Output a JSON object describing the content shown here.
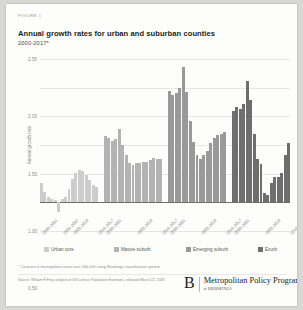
{
  "figure": {
    "label": "FIGURE 1",
    "title": "Annual growth rates for urban and suburban counties",
    "subtitle": "2000-2017*"
  },
  "footnote": "* Counties in metropolitan areas over 500,000 using Brookings classification system",
  "source": "Source: William H Frey analysis of US Census Population Estimates, released March 22, 2018",
  "brand": {
    "mark": "B",
    "name": "Metropolitan Policy Program",
    "sub": "at BROOKINGS"
  },
  "colors": {
    "urban_core": "#cccccc",
    "mature_suburb": "#b3b3b3",
    "emerging_suburb": "#999999",
    "exurb": "#6e6e6e",
    "gridline": "#e6e6e4",
    "axis": "#6e6e6c",
    "text_muted": "#8a8a88"
  },
  "chart_data": {
    "type": "bar",
    "title": "Annual growth rates for urban and suburban counties",
    "subtitle": "2000-2017*",
    "xlabel": "",
    "ylabel": "Annual growth rate",
    "ylim": [
      -0.5,
      2.5
    ],
    "yticks": [
      -0.5,
      0.0,
      0.5,
      1.0,
      1.5,
      2.0,
      2.5
    ],
    "ytick_labels": [
      "-0.50",
      "0.00",
      "0.50",
      "1.00",
      "1.50",
      "2.00",
      "2.50"
    ],
    "grid": true,
    "legend_position": "bottom",
    "x": [
      "2000-2001",
      "2001-2002",
      "2002-2003",
      "2003-2004",
      "2004-2005",
      "2005-2006",
      "2006-2007",
      "2007-2008",
      "2008-2009",
      "2009-2010",
      "2010-2011",
      "2011-2012",
      "2012-2013",
      "2013-2014",
      "2014-2015",
      "2015-2016",
      "2016-2017"
    ],
    "xtick_labels": [
      "2000-2001",
      "2006-2007",
      "2009-2010",
      "2016-2017",
      "2000-2001",
      "2009-2010",
      "2016-2017",
      "2000-2001",
      "2009-2010",
      "2016-2017",
      "2000-2001",
      "2009-2010",
      "2016-2017"
    ],
    "series": [
      {
        "name": "Urban core",
        "color": "#cccccc",
        "values": [
          0.33,
          0.18,
          0.1,
          0.06,
          0.04,
          -0.17,
          0.05,
          0.1,
          0.24,
          0.4,
          0.52,
          0.56,
          0.54,
          0.47,
          0.39,
          0.31,
          0.26
        ]
      },
      {
        "name": "Mature suburb",
        "color": "#b3b3b3",
        "values": [
          1.16,
          1.12,
          1.07,
          1.11,
          1.28,
          1.0,
          0.83,
          0.69,
          0.65,
          0.68,
          0.69,
          0.71,
          0.7,
          0.73,
          0.78,
          0.75,
          0.76
        ]
      },
      {
        "name": "Emerging suburb",
        "color": "#999999",
        "values": [
          1.95,
          1.88,
          1.9,
          1.99,
          2.36,
          1.93,
          1.41,
          1.05,
          0.83,
          0.76,
          0.83,
          0.9,
          1.03,
          1.13,
          1.17,
          1.2,
          1.22
        ]
      },
      {
        "name": "Exurb",
        "color": "#6e6e6e",
        "values": [
          1.6,
          1.66,
          1.63,
          1.72,
          2.11,
          1.79,
          1.2,
          0.75,
          0.66,
          0.16,
          0.13,
          0.33,
          0.45,
          0.44,
          0.52,
          0.83,
          1.03
        ]
      }
    ]
  }
}
